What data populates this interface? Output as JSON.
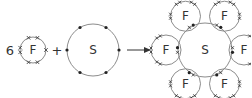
{
  "diagram": {
    "reactants": {
      "coefficient": "6",
      "fluorine": {
        "symbol": "F",
        "outer_electrons": 7,
        "electron_marker": "cross"
      },
      "plus": "+",
      "sulfur": {
        "symbol": "S",
        "outer_electrons": 6,
        "electron_marker": "dot"
      }
    },
    "arrow": "→",
    "product": {
      "central": "S",
      "outer": [
        "F",
        "F",
        "F",
        "F",
        "F",
        "F"
      ],
      "shared_pairs": 6
    }
  }
}
